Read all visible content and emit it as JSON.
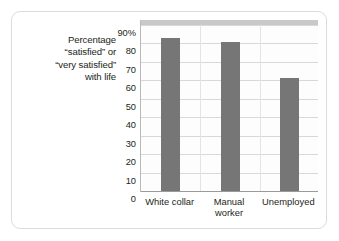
{
  "chart_data": {
    "type": "bar",
    "title": "",
    "subtitle": "",
    "xlabel": "",
    "ylabel": "Percentage \"satisfied\" or \"very satisfied\" with life",
    "ylabel_lines": [
      "Percentage",
      "“satisfied” or",
      "“very satisfied”",
      "with life"
    ],
    "categories": [
      "White collar",
      "Manual worker",
      "Unemployed"
    ],
    "category_lines": [
      [
        "White collar"
      ],
      [
        "Manual",
        "worker"
      ],
      [
        "Unemployed"
      ]
    ],
    "values": [
      83,
      81,
      61.5
    ],
    "ylim": [
      0,
      90
    ],
    "ytick_values": [
      0,
      10,
      20,
      30,
      40,
      50,
      60,
      70,
      80,
      90
    ],
    "ytick_labels": [
      "0",
      "10",
      "20",
      "30",
      "40",
      "50",
      "60",
      "70",
      "80",
      "90%"
    ],
    "grid": true,
    "legend": false,
    "legend_position": "none",
    "bar_color": "#767676",
    "gridline_color": "#d8d8d8",
    "axis_color": "#9a9a9a",
    "plot_background": "#fdfdfd",
    "card_background": "#ffffff",
    "card_border_color": "#dcdcdc",
    "text_color": "#231f20"
  }
}
